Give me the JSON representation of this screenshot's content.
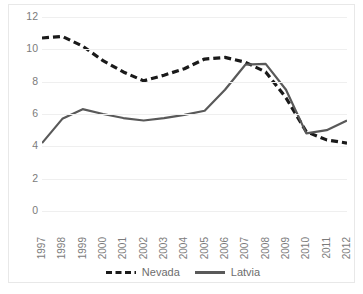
{
  "chart_data": {
    "type": "line",
    "title": "",
    "xlabel": "",
    "ylabel": "",
    "categories": [
      "1997",
      "1998",
      "1999",
      "2000",
      "2001",
      "2002",
      "2003",
      "2004",
      "2005",
      "2006",
      "2007",
      "2008",
      "2009",
      "2010",
      "2011",
      "2012"
    ],
    "ylim": [
      0,
      12
    ],
    "y_ticks": [
      0,
      2,
      4,
      6,
      8,
      10,
      12
    ],
    "grid": true,
    "legend_position": "bottom",
    "series": [
      {
        "name": "Nevada",
        "style": "dashed",
        "color": "#1a1a1a",
        "values": [
          10.7,
          10.8,
          10.2,
          9.3,
          8.6,
          8.05,
          8.4,
          8.8,
          9.4,
          9.5,
          9.2,
          8.6,
          7.0,
          4.9,
          4.4,
          4.2
        ]
      },
      {
        "name": "Latvia",
        "style": "solid",
        "color": "#595959",
        "values": [
          4.2,
          5.7,
          6.3,
          6.0,
          5.75,
          5.6,
          5.75,
          5.95,
          6.2,
          7.5,
          9.05,
          9.1,
          7.5,
          4.8,
          5.0,
          5.6
        ]
      }
    ]
  },
  "legend": {
    "items": [
      {
        "label": "Nevada"
      },
      {
        "label": "Latvia"
      }
    ]
  },
  "colors": {
    "nevada": "#1a1a1a",
    "latvia": "#595959",
    "grid": "#efefef",
    "tick_text": "#7b7b7b",
    "border": "#e8e8e8"
  }
}
